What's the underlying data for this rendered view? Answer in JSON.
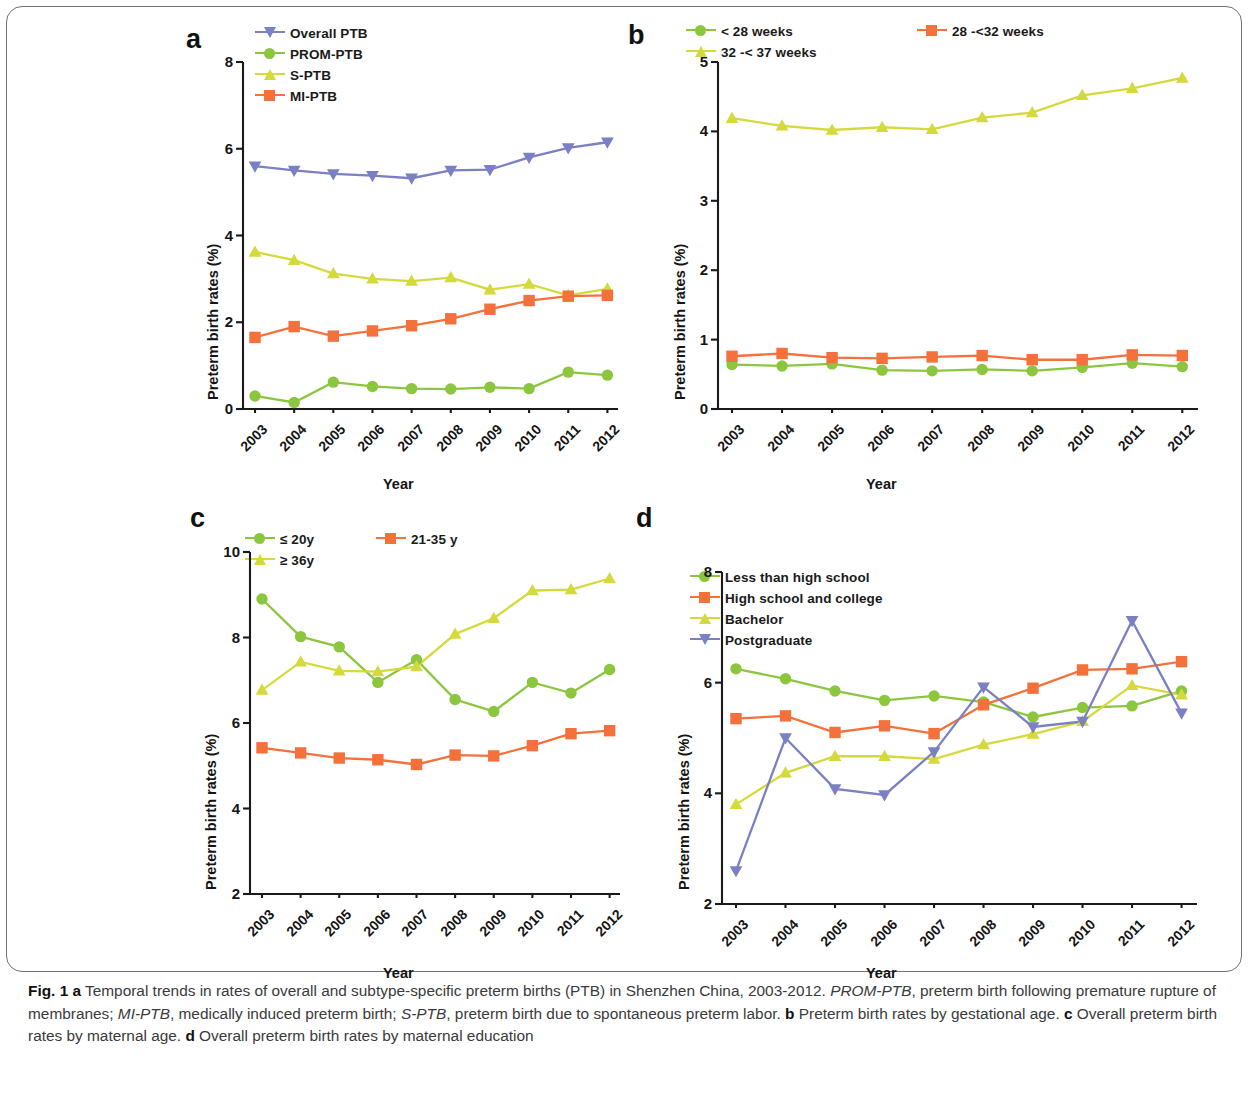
{
  "figure": {
    "caption_parts": {
      "fig_label": "Fig. 1",
      "a_mark": "a",
      "a_text": " Temporal trends in rates of overall and subtype-specific preterm births (PTB) in Shenzhen China, 2003-2012. ",
      "prom_abbr": "PROM-PTB",
      "prom_text": ", preterm birth following premature rupture of membranes; ",
      "mi_abbr": "MI-PTB",
      "mi_text": ", medically induced preterm birth; ",
      "s_abbr": "S-PTB",
      "s_text": ", preterm birth due to spontaneous preterm labor. ",
      "b_mark": "b",
      "b_text": " Preterm birth rates by gestational age. ",
      "c_mark": "c",
      "c_text": " Overall preterm birth rates by maternal age. ",
      "d_mark": "d",
      "d_text": " Overall preterm birth rates by maternal education"
    }
  },
  "colors": {
    "purple": "#7b7fc4",
    "green": "#8cc63f",
    "yellow": "#d4da3c",
    "orange": "#f4713c",
    "axis": "#1a1a1a"
  },
  "chart_data": [
    {
      "panel": "a",
      "type": "line",
      "title": "",
      "xlabel": "Year",
      "ylabel": "Preterm birth rates (%)",
      "categories": [
        "2003",
        "2004",
        "2005",
        "2006",
        "2007",
        "2008",
        "2009",
        "2010",
        "2011",
        "2012"
      ],
      "yticks": [
        0,
        2,
        4,
        6,
        8
      ],
      "ylim": [
        0,
        8
      ],
      "grid": false,
      "legend_position": "top",
      "series": [
        {
          "name": "Overall PTB",
          "marker": "triangle-down",
          "color": "#7b7fc4",
          "values": [
            5.6,
            5.5,
            5.42,
            5.38,
            5.32,
            5.5,
            5.52,
            5.8,
            6.02,
            6.15
          ]
        },
        {
          "name": "PROM-PTB",
          "marker": "circle",
          "color": "#8cc63f",
          "values": [
            0.3,
            0.15,
            0.62,
            0.52,
            0.47,
            0.46,
            0.5,
            0.47,
            0.85,
            0.78
          ]
        },
        {
          "name": "S-PTB",
          "marker": "triangle-up",
          "color": "#d4da3c",
          "values": [
            3.62,
            3.43,
            3.12,
            3.0,
            2.95,
            3.03,
            2.75,
            2.88,
            2.62,
            2.77
          ]
        },
        {
          "name": "MI-PTB",
          "marker": "square",
          "color": "#f4713c",
          "values": [
            1.65,
            1.9,
            1.68,
            1.8,
            1.92,
            2.08,
            2.3,
            2.5,
            2.6,
            2.62
          ]
        }
      ]
    },
    {
      "panel": "b",
      "type": "line",
      "title": "",
      "xlabel": "Year",
      "ylabel": "Preterm birth rates (%)",
      "categories": [
        "2003",
        "2004",
        "2005",
        "2006",
        "2007",
        "2008",
        "2009",
        "2010",
        "2011",
        "2012"
      ],
      "yticks": [
        0,
        1,
        2,
        3,
        4,
        5
      ],
      "ylim": [
        0,
        5
      ],
      "grid": false,
      "legend_position": "top",
      "series": [
        {
          "name": "< 28 weeks",
          "marker": "circle",
          "color": "#8cc63f",
          "values": [
            0.64,
            0.62,
            0.65,
            0.56,
            0.55,
            0.57,
            0.55,
            0.6,
            0.66,
            0.61
          ]
        },
        {
          "name": "28 -<32 weeks",
          "marker": "square",
          "color": "#f4713c",
          "values": [
            0.76,
            0.8,
            0.74,
            0.73,
            0.75,
            0.77,
            0.71,
            0.71,
            0.78,
            0.77
          ]
        },
        {
          "name": "32 -< 37 weeks",
          "marker": "triangle-up",
          "color": "#d4da3c",
          "values": [
            4.19,
            4.08,
            4.02,
            4.06,
            4.03,
            4.2,
            4.27,
            4.52,
            4.62,
            4.77
          ]
        }
      ]
    },
    {
      "panel": "c",
      "type": "line",
      "title": "",
      "xlabel": "Year",
      "ylabel": "Preterm birth rates (%)",
      "categories": [
        "2003",
        "2004",
        "2005",
        "2006",
        "2007",
        "2008",
        "2009",
        "2010",
        "2011",
        "2012"
      ],
      "yticks": [
        2,
        4,
        6,
        8,
        10
      ],
      "ylim": [
        2,
        10
      ],
      "grid": false,
      "legend_position": "top",
      "series": [
        {
          "name": "≤ 20y",
          "marker": "circle",
          "color": "#8cc63f",
          "values": [
            8.9,
            8.02,
            7.78,
            6.95,
            7.48,
            6.55,
            6.27,
            6.95,
            6.7,
            7.25
          ]
        },
        {
          "name": "21-35 y",
          "marker": "square",
          "color": "#f4713c",
          "values": [
            5.42,
            5.3,
            5.18,
            5.14,
            5.03,
            5.25,
            5.23,
            5.47,
            5.75,
            5.82
          ]
        },
        {
          "name": "≥ 36y",
          "marker": "triangle-up",
          "color": "#d4da3c",
          "values": [
            6.77,
            7.43,
            7.22,
            7.2,
            7.32,
            8.08,
            8.45,
            9.1,
            9.12,
            9.38
          ]
        }
      ]
    },
    {
      "panel": "d",
      "type": "line",
      "title": "",
      "xlabel": "Year",
      "ylabel": "Preterm birth rates (%)",
      "categories": [
        "2003",
        "2004",
        "2005",
        "2006",
        "2007",
        "2008",
        "2009",
        "2010",
        "2011",
        "2012"
      ],
      "yticks": [
        2,
        4,
        6,
        8
      ],
      "ylim": [
        2,
        8
      ],
      "grid": false,
      "legend_position": "top",
      "series": [
        {
          "name": "Less than high school",
          "marker": "circle",
          "color": "#8cc63f",
          "values": [
            6.25,
            6.07,
            5.85,
            5.68,
            5.76,
            5.65,
            5.38,
            5.55,
            5.58,
            5.85
          ]
        },
        {
          "name": "High school and college",
          "marker": "square",
          "color": "#f4713c",
          "values": [
            5.35,
            5.4,
            5.1,
            5.22,
            5.08,
            5.6,
            5.9,
            6.23,
            6.25,
            6.38
          ]
        },
        {
          "name": "Bachelor",
          "marker": "triangle-up",
          "color": "#d4da3c",
          "values": [
            3.8,
            4.37,
            4.67,
            4.67,
            4.62,
            4.88,
            5.07,
            5.3,
            5.95,
            5.78
          ]
        },
        {
          "name": "Postgraduate",
          "marker": "triangle-down",
          "color": "#7b7fc4",
          "values": [
            2.6,
            5.0,
            4.08,
            3.97,
            4.75,
            5.92,
            5.2,
            5.3,
            7.12,
            5.45
          ]
        }
      ]
    }
  ]
}
